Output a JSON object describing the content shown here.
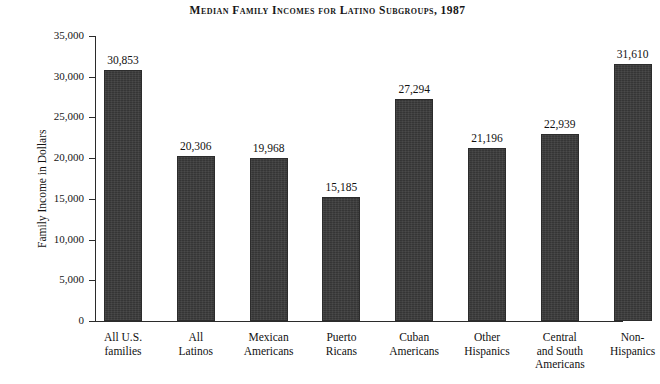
{
  "chart_data": {
    "type": "bar",
    "title": "Median Family Incomes for Latino Subgroups, 1987",
    "xlabel": "",
    "ylabel": "Family Income in Dollars",
    "ylim": [
      0,
      35000
    ],
    "ytick_step": 5000,
    "grid": false,
    "legend": "none",
    "bar_color": "#3b3b3b",
    "categories": [
      "All U.S. families",
      "All Latinos",
      "Mexican Americans",
      "Puerto Ricans",
      "Cuban Americans",
      "Other Hispanics",
      "Central and South Americans",
      "Non-Hispanics"
    ],
    "category_lines": [
      [
        "All U.S.",
        "families"
      ],
      [
        "All",
        "Latinos"
      ],
      [
        "Mexican",
        "Americans"
      ],
      [
        "Puerto",
        "Ricans"
      ],
      [
        "Cuban",
        "Americans"
      ],
      [
        "Other",
        "Hispanics"
      ],
      [
        "Central",
        "and South",
        "Americans"
      ],
      [
        "Non-",
        "Hispanics"
      ]
    ],
    "values": [
      30853,
      20306,
      19968,
      15185,
      27294,
      21196,
      22939,
      31610
    ],
    "value_labels": [
      "30,853",
      "20,306",
      "19,968",
      "15,185",
      "27,294",
      "21,196",
      "22,939",
      "31,610"
    ],
    "ytick_labels": [
      "35,000",
      "30,000",
      "25,000",
      "20,000",
      "15,000",
      "10,000",
      "5,000",
      "0"
    ],
    "ytick_values": [
      35000,
      30000,
      25000,
      20000,
      15000,
      10000,
      5000,
      0
    ]
  }
}
